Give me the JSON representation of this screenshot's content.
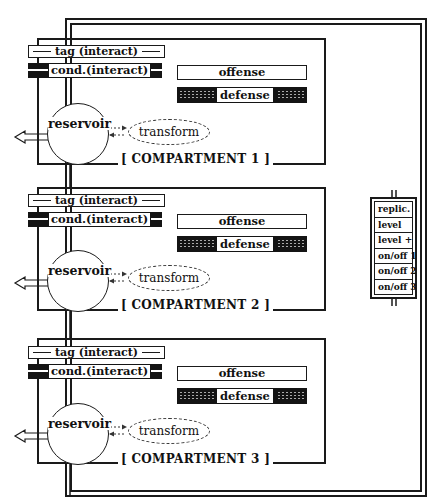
{
  "compartments": [
    {
      "title": "[ COMPARTMENT 1 ]",
      "tag_label": "tag (interact)",
      "cond_label": "cond.(interact)",
      "offense_label": "offense",
      "defense_label": "defense",
      "reservoir_label": "reservoir",
      "transform_label": "transform"
    },
    {
      "title": "[ COMPARTMENT 2 ]",
      "tag_label": "tag (interact)",
      "cond_label": "cond.(interact)",
      "offense_label": "offense",
      "defense_label": "defense",
      "reservoir_label": "reservoir",
      "transform_label": "transform"
    },
    {
      "title": "[ COMPARTMENT 3 ]",
      "tag_label": "tag (interact)",
      "cond_label": "cond.(interact)",
      "offense_label": "offense",
      "defense_label": "defense",
      "reservoir_label": "reservoir",
      "transform_label": "transform"
    }
  ],
  "control_panel": {
    "items": [
      {
        "label": "replic."
      },
      {
        "label": "level"
      },
      {
        "label": "level +"
      },
      {
        "label": "on/off 1"
      },
      {
        "label": "on/off 2"
      },
      {
        "label": "on/off 3"
      }
    ]
  },
  "colors": {
    "ink": "#1a1a1a",
    "background": "#ffffff"
  }
}
